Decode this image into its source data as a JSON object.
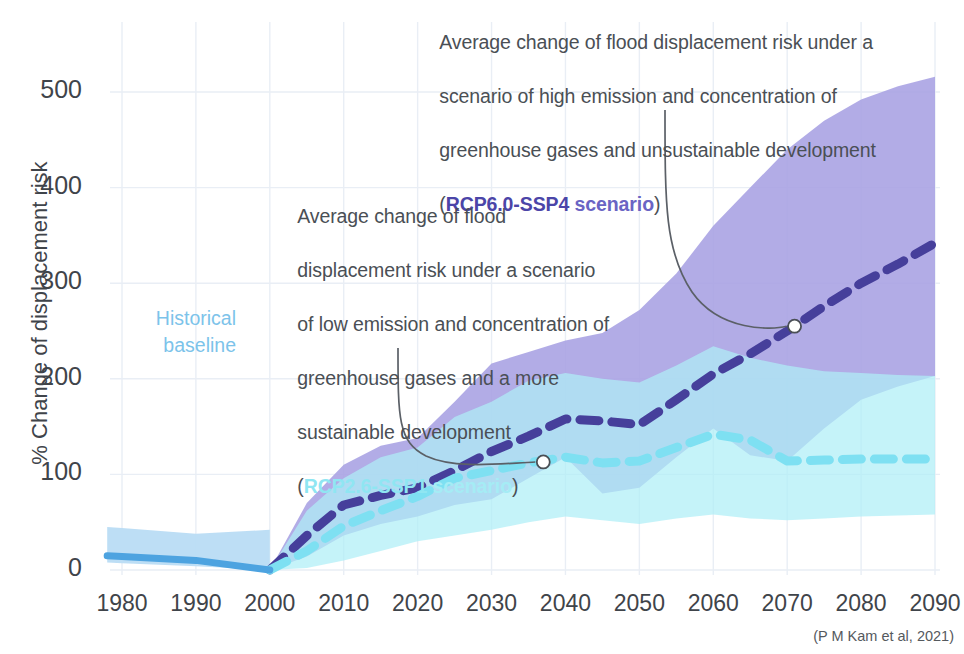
{
  "chart_data": {
    "type": "area",
    "title": "",
    "subtitle": "",
    "xlabel": "",
    "ylabel": "% Change of displacement risk",
    "xlim": [
      1975,
      2093
    ],
    "ylim": [
      -30,
      540
    ],
    "xticks": [
      1980,
      1990,
      2000,
      2010,
      2020,
      2030,
      2040,
      2050,
      2060,
      2070,
      2080,
      2090
    ],
    "yticks": [
      0,
      100,
      200,
      300,
      400,
      500
    ],
    "grid": true,
    "legend_position": "inline-annotations",
    "source": "(P M Kam et al, 2021)",
    "series": [
      {
        "name": "Historical baseline",
        "kind": "line-with-band",
        "color": "#4da3e0",
        "band_color": "#b9dcf4",
        "x": [
          1978,
          1980,
          1990,
          2000
        ],
        "values": [
          15,
          14,
          10,
          0
        ],
        "band_low": [
          8,
          7,
          4,
          0
        ],
        "band_high": [
          45,
          44,
          38,
          42
        ]
      },
      {
        "name": "RCP2.6-SSP1 scenario",
        "kind": "dashed-line-with-band",
        "color": "#7ee0f2",
        "band_color": "#bdf1f8",
        "x": [
          2000,
          2005,
          2010,
          2015,
          2020,
          2025,
          2030,
          2035,
          2040,
          2045,
          2050,
          2055,
          2060,
          2065,
          2070,
          2075,
          2080,
          2085,
          2090
        ],
        "values": [
          0,
          20,
          46,
          62,
          77,
          96,
          104,
          112,
          118,
          112,
          114,
          128,
          142,
          136,
          114,
          115,
          116,
          116,
          116
        ],
        "band_low": [
          0,
          2,
          10,
          20,
          30,
          36,
          42,
          50,
          56,
          52,
          48,
          54,
          58,
          54,
          52,
          54,
          56,
          57,
          58
        ],
        "band_high": [
          0,
          62,
          96,
          118,
          128,
          160,
          176,
          198,
          206,
          200,
          196,
          214,
          234,
          222,
          214,
          208,
          206,
          204,
          203
        ]
      },
      {
        "name": "RCP6.0-SSP4 scenario",
        "kind": "dashed-line-with-band",
        "color": "#463f9b",
        "band_color": "#a7a1e2",
        "x": [
          2000,
          2005,
          2010,
          2015,
          2020,
          2025,
          2030,
          2035,
          2040,
          2045,
          2050,
          2055,
          2060,
          2065,
          2070,
          2075,
          2080,
          2085,
          2090
        ],
        "values": [
          0,
          36,
          68,
          78,
          86,
          104,
          124,
          140,
          158,
          156,
          152,
          178,
          205,
          226,
          250,
          276,
          300,
          320,
          342
        ],
        "band_low": [
          0,
          14,
          36,
          48,
          56,
          68,
          74,
          96,
          118,
          80,
          86,
          118,
          148,
          120,
          114,
          148,
          178,
          192,
          203
        ],
        "band_high": [
          0,
          70,
          110,
          130,
          138,
          176,
          216,
          228,
          240,
          248,
          272,
          310,
          360,
          400,
          440,
          470,
          492,
          506,
          516
        ]
      }
    ],
    "annotations": [
      {
        "id": "high",
        "text": "Average change of flood displacement risk under a scenario of high emission and concentration of greenhouse gases and unsustainable development (RCP6.0-SSP4 scenario)",
        "lines": [
          "Average change of flood displacement risk under a",
          "scenario of high emission and concentration of",
          "greenhouse gases and unsustainable development"
        ],
        "prefix": "(",
        "highlight": "RCP6.0-SSP4",
        "suffix_highlight": " scenario",
        "suffix": ")",
        "target_point": {
          "x": 2071,
          "y": 255
        }
      },
      {
        "id": "low",
        "text": "Average change of flood displacement risk under a scenario of low emission and concentration of greenhouse gases and a more sustainable development (RCP2.6-SSP1 scenario)",
        "lines": [
          "Average change of flood",
          "displacement risk under a scenario",
          "of low emission and concentration of",
          "greenhouse gases and a more",
          "sustainable development"
        ],
        "prefix": "(",
        "highlight": "RCP2.6-SSP1",
        "suffix_highlight": " scenario",
        "suffix": ")",
        "target_point": {
          "x": 2037,
          "y": 113
        }
      },
      {
        "id": "historical",
        "lines": [
          "Historical",
          "baseline"
        ],
        "color": "#7cc3ea"
      }
    ]
  },
  "axis": {
    "ylabel": "% Change of displacement risk",
    "yticks": [
      "500",
      "400",
      "300",
      "200",
      "100",
      "0"
    ],
    "xticks": [
      "1980",
      "1990",
      "2000",
      "2010",
      "2020",
      "2030",
      "2040",
      "2050",
      "2060",
      "2070",
      "2080",
      "2090"
    ]
  },
  "annotations": {
    "high": {
      "line1": "Average change of flood displacement risk under a",
      "line2": "scenario of high emission and concentration of",
      "line3": "greenhouse gases and unsustainable development",
      "open_paren": "(",
      "scenario_name": "RCP6.0-SSP4",
      "scenario_word": " scenario",
      "close_paren": ")"
    },
    "low": {
      "line1": "Average change of flood",
      "line2": "displacement risk under a scenario",
      "line3": "of low emission and concentration of",
      "line4": "greenhouse gases and a more",
      "line5": "sustainable development",
      "open_paren": "(",
      "scenario_name": "RCP2.6-SSP1",
      "scenario_word": " scenario",
      "close_paren": ")"
    },
    "historical": {
      "line1": "Historical",
      "line2": "baseline"
    }
  },
  "source": "(P M Kam et al, 2021)",
  "colors": {
    "historical_line": "#4da3e0",
    "historical_band": "#b9dcf4",
    "rcp26_line": "#7ee0f2",
    "rcp26_band": "#bdf1f8",
    "rcp60_line": "#463f9b",
    "rcp60_band": "#a7a1e2",
    "text": "#3f444a",
    "grid": "#e9eef5"
  }
}
